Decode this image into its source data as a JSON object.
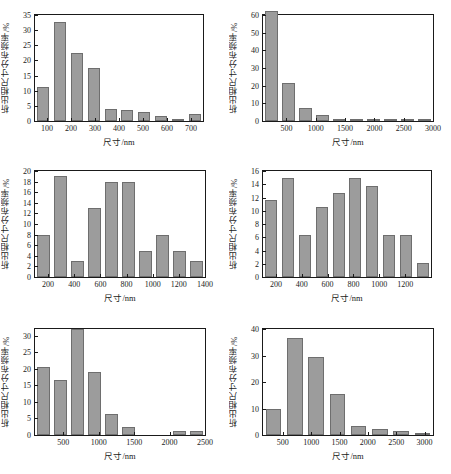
{
  "figure": {
    "axis_label_x": "尺寸/nm",
    "axis_label_y": "析出相尺寸分布频率/%",
    "bar_color": "#9c9c9c",
    "bar_edge_color": "#6e6e6e",
    "axis_color": "#1a1a1a",
    "background": "#ffffff"
  },
  "chart_data": [
    {
      "type": "bar",
      "panel": "(a)",
      "title": "",
      "xlabel": "尺寸/nm",
      "ylabel": "析出相尺寸分布频率/%",
      "xlim": [
        50,
        750
      ],
      "ylim": [
        0,
        35
      ],
      "yticks": [
        0,
        5,
        10,
        15,
        20,
        25,
        30,
        35
      ],
      "xticks": [
        100,
        200,
        300,
        400,
        500,
        600,
        700
      ],
      "bin_width": 70,
      "categories": [
        "50-120",
        "120-190",
        "190-260",
        "260-330",
        "330-400",
        "400-470",
        "470-540",
        "540-610",
        "610-680",
        "680-750"
      ],
      "bin_centers": [
        85,
        155,
        225,
        295,
        365,
        435,
        505,
        575,
        645,
        715
      ],
      "values": [
        11.2,
        32.8,
        22.5,
        17.6,
        3.9,
        3.8,
        3.0,
        1.5,
        0.6,
        2.4
      ],
      "grid": false,
      "legend": "none"
    },
    {
      "type": "bar",
      "panel": "(b)",
      "title": "",
      "xlabel": "尺寸/nm",
      "ylabel": "析出相尺寸分布频率/%",
      "xlim": [
        100,
        3000
      ],
      "ylim": [
        0,
        60
      ],
      "yticks": [
        0,
        10,
        20,
        30,
        40,
        50,
        60
      ],
      "xticks": [
        500,
        1000,
        1500,
        2000,
        2500,
        3000
      ],
      "bin_width": 290,
      "categories": [
        "100-390",
        "390-680",
        "680-970",
        "970-1260",
        "1260-1550",
        "1550-1840",
        "1840-2130",
        "2130-2420",
        "2420-2710",
        "2710-3000"
      ],
      "bin_centers": [
        245,
        535,
        825,
        1115,
        1405,
        1695,
        1985,
        2275,
        2565,
        2855
      ],
      "values": [
        62.0,
        21.5,
        7.2,
        3.5,
        0.4,
        0.3,
        0.3,
        0.3,
        0.3,
        0.3
      ],
      "grid": false,
      "legend": "none"
    },
    {
      "type": "bar",
      "panel": "(c)",
      "title": "",
      "xlabel": "尺寸/nm",
      "ylabel": "析出相尺寸分布频率/%",
      "xlim": [
        100,
        1400
      ],
      "ylim": [
        0,
        20
      ],
      "yticks": [
        0,
        2,
        4,
        6,
        8,
        10,
        12,
        14,
        16,
        18,
        20
      ],
      "xticks": [
        200,
        400,
        600,
        800,
        1000,
        1200,
        1400
      ],
      "bin_width": 130,
      "categories": [
        "100-230",
        "230-360",
        "360-490",
        "490-620",
        "620-750",
        "750-880",
        "880-1010",
        "1010-1140",
        "1140-1270",
        "1270-1400"
      ],
      "bin_centers": [
        165,
        295,
        425,
        555,
        685,
        815,
        945,
        1075,
        1205,
        1335
      ],
      "values": [
        8,
        19,
        3,
        13,
        18,
        18,
        5,
        8,
        5,
        3
      ],
      "grid": false,
      "legend": "none"
    },
    {
      "type": "bar",
      "panel": "(d)",
      "title": "",
      "xlabel": "尺寸/nm",
      "ylabel": "析出相尺寸分布频率/%",
      "xlim": [
        100,
        1400
      ],
      "ylim": [
        0,
        16
      ],
      "yticks": [
        0,
        2,
        4,
        6,
        8,
        10,
        12,
        14,
        16
      ],
      "xticks": [
        200,
        400,
        600,
        800,
        1000,
        1200
      ],
      "bin_width": 130,
      "categories": [
        "100-230",
        "230-360",
        "360-490",
        "490-620",
        "620-750",
        "750-880",
        "880-1010",
        "1010-1140",
        "1140-1270",
        "1270-1400"
      ],
      "bin_centers": [
        165,
        295,
        425,
        555,
        685,
        815,
        945,
        1075,
        1205,
        1335
      ],
      "values": [
        11.7,
        14.9,
        6.4,
        10.6,
        12.7,
        14.9,
        13.7,
        6.4,
        6.4,
        2.1
      ],
      "grid": false,
      "legend": "none"
    },
    {
      "type": "bar",
      "panel": "(e)",
      "title": "",
      "xlabel": "尺寸/nm",
      "ylabel": "析出相尺寸分布频率/%",
      "xlim": [
        100,
        2500
      ],
      "ylim": [
        0,
        32
      ],
      "yticks": [
        0,
        5,
        10,
        15,
        20,
        25,
        30
      ],
      "xticks": [
        500,
        1000,
        1500,
        2000,
        2500
      ],
      "bin_width": 240,
      "categories": [
        "100-340",
        "340-580",
        "580-820",
        "820-1060",
        "1060-1300",
        "1300-1540",
        "1540-1780",
        "1780-2020",
        "2020-2260",
        "2260-2500"
      ],
      "bin_centers": [
        220,
        460,
        700,
        940,
        1180,
        1420,
        1660,
        1900,
        2140,
        2380
      ],
      "values": [
        20.4,
        16.6,
        32.1,
        19.1,
        6.3,
        2.5,
        0.0,
        0.0,
        1.2,
        1.2
      ],
      "grid": false,
      "legend": "none"
    },
    {
      "type": "bar",
      "panel": "(f)",
      "title": "",
      "xlabel": "尺寸/nm",
      "ylabel": "析出相尺寸分布频率/%",
      "xlim": [
        150,
        3150
      ],
      "ylim": [
        0,
        40
      ],
      "yticks": [
        0,
        10,
        20,
        30,
        40
      ],
      "xticks": [
        500,
        1000,
        1500,
        2000,
        2500,
        3000
      ],
      "bin_width": 375,
      "categories": [
        "150-525",
        "525-900",
        "900-1275",
        "1275-1650",
        "1650-2025",
        "2025-2400",
        "2400-2775",
        "2775-3150"
      ],
      "bin_centers": [
        337,
        712,
        1087,
        1462,
        1837,
        2212,
        2587,
        2962
      ],
      "values": [
        9.9,
        36.7,
        29.5,
        15.6,
        3.5,
        2.3,
        1.4,
        0.8
      ],
      "grid": false,
      "legend": "none"
    }
  ]
}
